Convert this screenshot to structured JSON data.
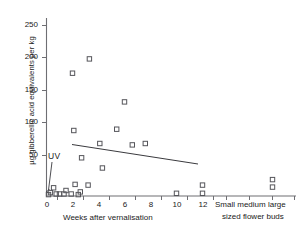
{
  "chart_data": {
    "type": "scatter",
    "title": "",
    "xlabel": "Weeks after vernalisation",
    "ylabel": "µg gibberellic acid equivalents per kg",
    "ylim": [
      0,
      270
    ],
    "xlim": [
      0,
      13
    ],
    "yticks": [
      0,
      50,
      100,
      150,
      200,
      250
    ],
    "ytick_labels": [
      "0",
      "50",
      "100",
      "150",
      "200",
      "250"
    ],
    "xticks": [
      0,
      2,
      4,
      6,
      8,
      10,
      12
    ],
    "xtick_labels": [
      "0",
      "2",
      "4",
      "6",
      "8",
      "10",
      "12"
    ],
    "grid": false,
    "legend": null,
    "annotations": [
      {
        "text": "UV",
        "x": 0.6,
        "y": 45
      }
    ],
    "secondary_axis": {
      "label_line1": "Small medium large",
      "label_line2": "sized flower buds",
      "categories": [
        "Small",
        "medium",
        "large"
      ]
    },
    "series": [
      {
        "name": "gibberellic acid equivalents",
        "marker": "open-square",
        "points": [
          {
            "x": 2.0,
            "y": 180
          },
          {
            "x": 3.3,
            "y": 201
          },
          {
            "x": 6.0,
            "y": 138
          },
          {
            "x": 2.1,
            "y": 96
          },
          {
            "x": 5.4,
            "y": 98
          },
          {
            "x": 4.1,
            "y": 77
          },
          {
            "x": 6.6,
            "y": 75
          },
          {
            "x": 7.6,
            "y": 77
          },
          {
            "x": 2.7,
            "y": 56
          },
          {
            "x": 4.3,
            "y": 41
          },
          {
            "x": 2.2,
            "y": 17
          },
          {
            "x": 3.2,
            "y": 16
          },
          {
            "x": 0.55,
            "y": 12
          },
          {
            "x": 1.5,
            "y": 8
          },
          {
            "x": 2.6,
            "y": 6
          },
          {
            "x": 0.3,
            "y": 5
          },
          {
            "x": 0.75,
            "y": 3
          },
          {
            "x": 1.0,
            "y": 3
          },
          {
            "x": 1.35,
            "y": 3
          },
          {
            "x": 1.9,
            "y": 3
          },
          {
            "x": 2.45,
            "y": 2
          },
          {
            "x": 0.15,
            "y": 2
          },
          {
            "x": 10.0,
            "y": 4
          },
          {
            "x": 12.0,
            "y": 16
          },
          {
            "x": 12.0,
            "y": 4
          }
        ],
        "category_points": [
          {
            "cat": "large",
            "y": 24
          },
          {
            "cat": "large",
            "y": 13
          }
        ]
      }
    ],
    "trend_line": {
      "x1": 2.0,
      "y1": 80,
      "x2": 10.0,
      "y2": 50
    }
  }
}
